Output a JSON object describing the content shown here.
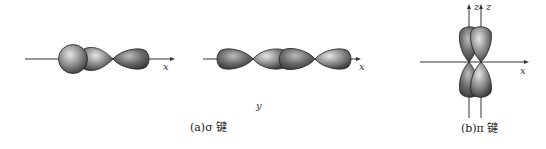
{
  "figure": {
    "panel_a": {
      "caption": "(a)σ 键",
      "diagram1": {
        "axis_label": "x",
        "description": "s orbital overlapping p orbital along x axis"
      },
      "diagram2": {
        "axis_label": "x",
        "description": "two p orbitals overlapping head-on along x axis"
      },
      "extra_label": "y"
    },
    "panel_b": {
      "caption": "(b)π 键",
      "axis_labels": {
        "z1": "z",
        "z2": "z",
        "x": "x"
      },
      "description": "two p orbitals overlapping side-by-side, perpendicular to x axis"
    }
  },
  "colors": {
    "lobe_dark": "#4a4a4a",
    "lobe_light": "#d8d8d8",
    "axis": "#333333"
  }
}
